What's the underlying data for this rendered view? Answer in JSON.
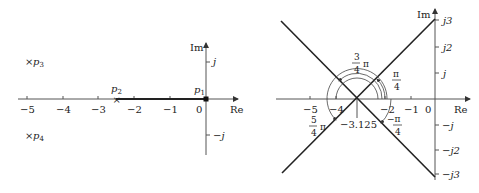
{
  "left_plot": {
    "axis_labels": {
      "re": "Re",
      "im": "Im"
    },
    "x_ticks": [
      "−5",
      "−4",
      "−3",
      "−2",
      "−1",
      "0"
    ],
    "y_ticks": [
      "j",
      "−j"
    ],
    "poles": [
      {
        "label": "p",
        "sub": "1",
        "re": 0,
        "im": 0
      },
      {
        "label": "p",
        "sub": "2",
        "re": -2.5,
        "im": 0
      },
      {
        "label": "p",
        "sub": "3",
        "re": -5,
        "im": 1
      },
      {
        "label": "p",
        "sub": "4",
        "re": -5,
        "im": -1
      }
    ],
    "pole_marker": "×"
  },
  "right_plot": {
    "axis_labels": {
      "re": "Re",
      "im": "Im"
    },
    "x_ticks": [
      "−5",
      "−4",
      "−2",
      "−1",
      "0"
    ],
    "y_ticks": [
      "j3",
      "j2",
      "j",
      "−j",
      "−j2",
      "−j3"
    ],
    "centroid": "−3.125",
    "angles": {
      "a1_num": "π",
      "a1_den": "4",
      "a2_num": "3",
      "a2_den": "4",
      "a2_pi": "π",
      "a3_num": "5",
      "a3_den": "4",
      "a3_pi": "π",
      "a4_num": "−π",
      "a4_den": "4"
    }
  }
}
